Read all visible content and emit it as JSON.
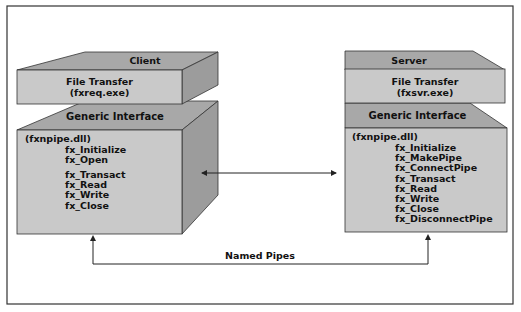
{
  "colors": {
    "front": "#c9c9c9",
    "top": "#a8a8a8",
    "side": "#9c9c9c",
    "line": "#222222",
    "background": "#ffffff"
  },
  "client": {
    "title": "Client",
    "app_title": "File Transfer",
    "app_exe": "(fxreq.exe)",
    "interface_title": "Generic Interface",
    "dll": "(fxnpipe.dll)",
    "functions_group1": [
      "fx_Initialize",
      "fx_Open"
    ],
    "functions_group2": [
      "fx_Transact",
      "fx_Read",
      "fx_Write",
      "fx_Close"
    ]
  },
  "server": {
    "title": "Server",
    "app_title": "File Transfer",
    "app_exe": "(fxsvr.exe)",
    "interface_title": "Generic Interface",
    "dll": "(fxnpipe.dll)",
    "functions": [
      "fx_Initialize",
      "fx_MakePipe",
      "fx_ConnectPipe",
      "fx_Transact",
      "fx_Read",
      "fx_Write",
      "fx_Close",
      "fx_DisconnectPipe"
    ]
  },
  "connector": {
    "label": "Named Pipes"
  }
}
